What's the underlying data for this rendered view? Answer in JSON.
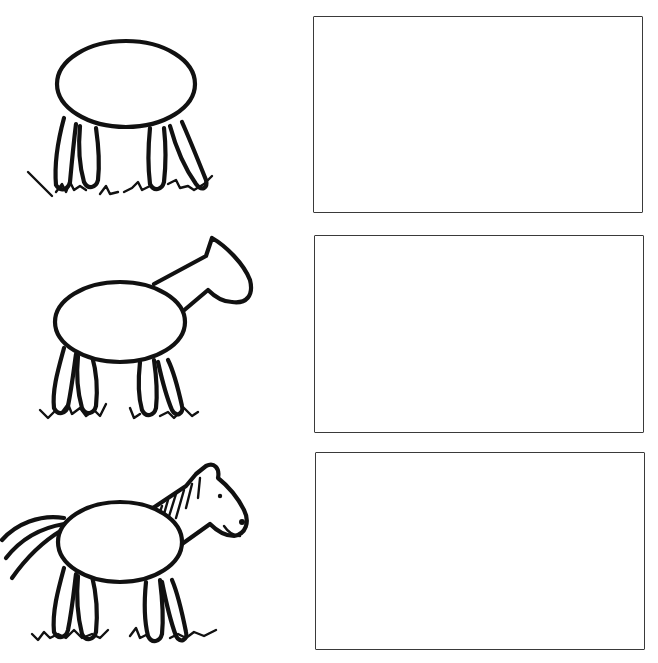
{
  "worksheet": {
    "type": "step-by-step drawing practice",
    "subject": "horse",
    "background_color": "#ffffff",
    "ink_color": "#111111",
    "steps": [
      {
        "step": 1,
        "drawing": "oval body with four legs standing on grass",
        "icon": "horse-body-legs-icon",
        "practice_box": {
          "x": 313,
          "y": 16,
          "width": 330,
          "height": 197,
          "content": ""
        }
      },
      {
        "step": 2,
        "drawing": "body and legs with neck and head outline added",
        "icon": "horse-head-outline-icon",
        "practice_box": {
          "x": 314,
          "y": 235,
          "width": 330,
          "height": 198,
          "content": ""
        }
      },
      {
        "step": 3,
        "drawing": "complete horse with mane, ear, eye, nostril and tail",
        "icon": "horse-complete-icon",
        "practice_box": {
          "x": 315,
          "y": 452,
          "width": 330,
          "height": 198,
          "content": ""
        }
      }
    ]
  }
}
